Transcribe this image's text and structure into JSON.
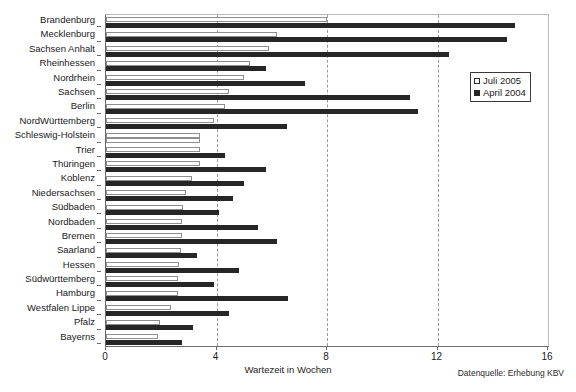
{
  "chart_data": {
    "type": "bar",
    "orientation": "horizontal",
    "title": "",
    "xlabel": "Wartezeit in Wochen",
    "ylabel": "",
    "xlim": [
      0,
      16
    ],
    "xticks": [
      0,
      4,
      8,
      12,
      16
    ],
    "xtick_labels": [
      "0",
      "4",
      "8",
      "12",
      "16"
    ],
    "grid": "vertical dashed gridlines at 4, 8, 12",
    "legend_position": "upper right inside plot",
    "source_note": "Datenquelle: Erhebung  KBV",
    "categories": [
      "Brandenburg",
      "Mecklenburg",
      "Sachsen Anhalt",
      "Rheinhessen",
      "Nordrhein",
      "Sachsen",
      "Berlin",
      "NordWürttemberg",
      "Schleswig-Holstein",
      "Trier",
      "Thüringen",
      "Koblenz",
      "Niedersachsen",
      "Südbaden",
      "Nordbaden",
      "Bremen",
      "Saarland",
      "Hessen",
      "Südwürttemberg",
      "Hamburg",
      "Westfalen Lippe",
      "Pfalz",
      "Bayerns"
    ],
    "series": [
      {
        "name": "Juli 2005",
        "style": "white bar with black outline",
        "color": "#ffffff",
        "values": [
          8.0,
          6.2,
          5.9,
          5.2,
          5.0,
          4.45,
          4.3,
          3.9,
          3.4,
          3.4,
          3.4,
          3.1,
          2.9,
          2.8,
          2.75,
          2.75,
          2.7,
          2.65,
          2.6,
          2.6,
          2.35,
          1.95,
          1.9
        ]
      },
      {
        "name": "April 2004",
        "style": "solid dark bar",
        "color": "#262626",
        "values": [
          14.8,
          14.5,
          12.4,
          5.8,
          7.2,
          11.0,
          11.3,
          6.55,
          3.4,
          4.3,
          5.8,
          5.0,
          4.6,
          4.1,
          5.5,
          6.2,
          3.3,
          4.8,
          3.9,
          6.6,
          4.45,
          3.15,
          2.75
        ]
      }
    ]
  },
  "legend": {
    "items": [
      {
        "label": "Juli 2005",
        "swatch": "light-swatch-icon"
      },
      {
        "label": "April 2004",
        "swatch": "dark-swatch-icon"
      }
    ]
  }
}
